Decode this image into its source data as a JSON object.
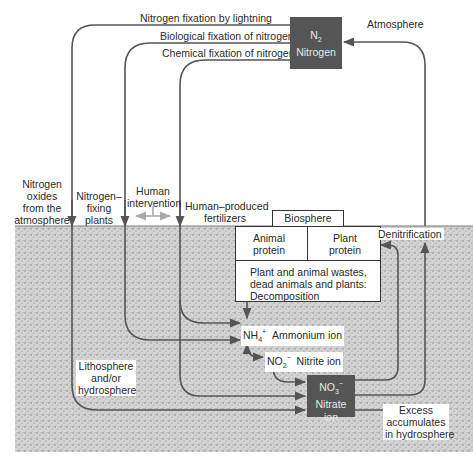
{
  "diagram": {
    "regions": {
      "atmosphere": "Atmosphere",
      "lithosphere": [
        "Lithosphere",
        "and/or",
        "hydrosphere"
      ]
    },
    "nodes": {
      "n2": {
        "formula": "N",
        "subscript": "2",
        "name": "Nitrogen"
      },
      "biosphere": {
        "title": "Biosphere",
        "animal": [
          "Animal",
          "protein"
        ],
        "plant": [
          "Plant",
          "protein"
        ],
        "decomposition": [
          "Plant and animal wastes,",
          "dead animals and plants:",
          "Decomposition"
        ]
      },
      "ammonium": {
        "formula": "NH",
        "subscript": "4",
        "charge": "+",
        "name": "Ammonium ion"
      },
      "nitrite": {
        "formula": "NO",
        "subscript": "2",
        "charge": "−",
        "name": "Nitrite ion"
      },
      "nitrate": {
        "formula": "NO",
        "subscript": "3",
        "charge": "−",
        "name": [
          "Nitrate",
          "ion"
        ]
      }
    },
    "flows": {
      "lightning": "Nitrogen fixation by lightning",
      "biological": "Biological fixation of nitrogen",
      "chemical": "Chemical fixation of nitrogen",
      "oxides": [
        "Nitrogen",
        "oxides",
        "from the",
        "atmosphere"
      ],
      "fixing_plants": [
        "Nitrogen–",
        "fixing",
        "plants"
      ],
      "human_intervention": [
        "Human",
        "intervention"
      ],
      "fertilizers": [
        "Human–produced",
        "fertilizers"
      ],
      "denitrification": "Denitrification",
      "excess": [
        "Excess",
        "accumulates",
        "in hydrosphere"
      ]
    },
    "colors": {
      "line": "#555555",
      "dark_box": "#555555",
      "ground": "#cfcfcf",
      "intervention_arrow": "#aaaaaa"
    }
  }
}
